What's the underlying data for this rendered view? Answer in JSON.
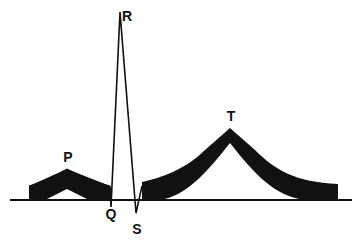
{
  "diagram": {
    "colors": {
      "ink": "#111111",
      "background": "#ffffff"
    },
    "labels": {
      "P": "P",
      "Q": "Q",
      "R": "R",
      "S": "S",
      "T": "T"
    },
    "waves": [
      {
        "name": "P",
        "type": "band",
        "peak_x": 67,
        "peak_y": 169
      },
      {
        "name": "Q",
        "type": "point",
        "x": 111,
        "y": 207
      },
      {
        "name": "R",
        "type": "point",
        "x": 120,
        "y": 12
      },
      {
        "name": "S",
        "type": "point",
        "x": 136,
        "y": 213
      },
      {
        "name": "T",
        "type": "band",
        "peak_x": 230,
        "peak_y": 128
      }
    ],
    "baseline_y": 200
  }
}
